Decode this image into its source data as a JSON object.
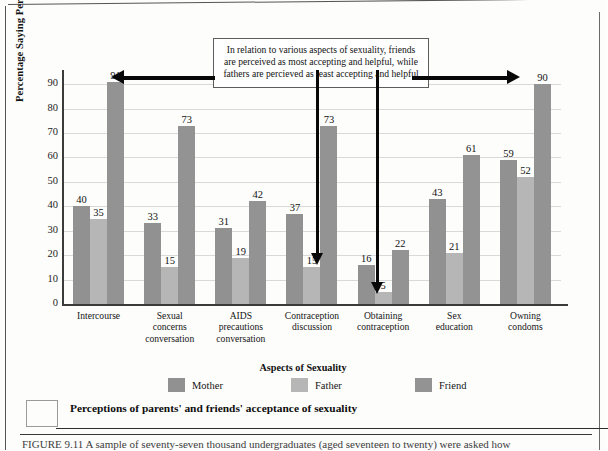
{
  "chart_data": {
    "type": "bar",
    "title": "",
    "xlabel": "Aspects of Sexuality",
    "ylabel": "Percentage Saying Person Would Approve",
    "ylim": [
      0,
      95
    ],
    "yticks": [
      0,
      10,
      20,
      30,
      40,
      50,
      60,
      70,
      80,
      90
    ],
    "grid": true,
    "legend_position": "bottom",
    "categories": [
      "Intercourse",
      "Sexual concerns conversation",
      "AIDS precautions conversation",
      "Contraception discussion",
      "Obtaining contraception",
      "Sex education",
      "Owning condoms"
    ],
    "category_lines": [
      [
        "Intercourse"
      ],
      [
        "Sexual",
        "concerns",
        "conversation"
      ],
      [
        "AIDS",
        "precautions",
        "conversation"
      ],
      [
        "Contraception",
        "discussion"
      ],
      [
        "Obtaining",
        "contraception"
      ],
      [
        "Sex",
        "education"
      ],
      [
        "Owning",
        "condoms"
      ]
    ],
    "series": [
      {
        "name": "Mother",
        "color": "#919191",
        "values": [
          40,
          33,
          31,
          37,
          16,
          43,
          59
        ]
      },
      {
        "name": "Father",
        "color": "#b6b6b6",
        "values": [
          35,
          15,
          19,
          15,
          5,
          21,
          52
        ]
      },
      {
        "name": "Friend",
        "color": "#939393",
        "values": [
          91,
          73,
          42,
          73,
          22,
          61,
          90
        ]
      }
    ],
    "annotations": [
      {
        "name": "callout",
        "text": "In relation to various aspects of sexuality, friends are perceived as most accepting and helpful, while fathers are percieved as least accepting and helpful"
      }
    ]
  },
  "axis": {
    "ylabel": "Percentage Saying Person Would Approve",
    "xlabel": "Aspects of Sexuality"
  },
  "legend": {
    "items": [
      {
        "label": "Mother"
      },
      {
        "label": "Father"
      },
      {
        "label": "Friend"
      }
    ]
  },
  "caption": {
    "title": "Perceptions of parents' and friends' acceptance of sexuality",
    "figure_text": "FIGURE 9.11   A sample of seventy-seven thousand undergraduates (aged seventeen to twenty) were asked how"
  }
}
